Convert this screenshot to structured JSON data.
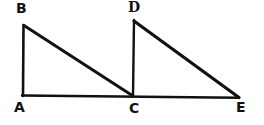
{
  "figure": {
    "kind": "hand-drawn-geometry-diagram",
    "background_color": "#ffffff",
    "stroke_color": "#111111",
    "canvas": {
      "width": 264,
      "height": 125
    },
    "labels": [
      {
        "id": "B",
        "text": "B",
        "x": 16,
        "y": 1
      },
      {
        "id": "D",
        "text": "D",
        "x": 128,
        "y": 0
      },
      {
        "id": "A",
        "text": "A",
        "x": 14,
        "y": 100
      },
      {
        "id": "C",
        "text": "C",
        "x": 129,
        "y": 101
      },
      {
        "id": "E",
        "text": "E",
        "x": 236,
        "y": 100
      }
    ],
    "points": {
      "A": {
        "x": 23,
        "y": 96
      },
      "B": {
        "x": 24,
        "y": 25
      },
      "C": {
        "x": 133,
        "y": 96
      },
      "D": {
        "x": 134,
        "y": 20
      },
      "E": {
        "x": 239,
        "y": 98
      }
    },
    "segments": [
      {
        "name": "AB",
        "from": "A",
        "to": "B",
        "width": 2.6
      },
      {
        "name": "BC",
        "from": "B",
        "to": "C",
        "width": 3.0
      },
      {
        "name": "AE",
        "from": "A",
        "to": "E",
        "width": 2.4
      },
      {
        "name": "CD",
        "from": "C",
        "to": "D",
        "width": 2.4
      },
      {
        "name": "DE",
        "from": "D",
        "to": "E",
        "width": 3.2
      }
    ]
  }
}
